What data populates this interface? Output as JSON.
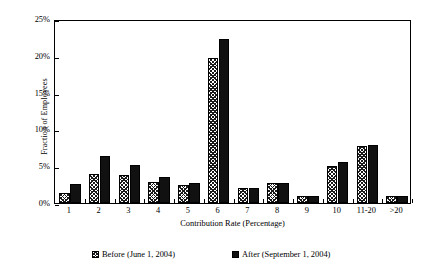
{
  "chart_data": {
    "type": "bar",
    "title": "",
    "xlabel": "Contribution Rate (Percentage)",
    "ylabel": "Fraction of Employees",
    "categories": [
      "1",
      "2",
      "3",
      "4",
      "5",
      "6",
      "7",
      "8",
      "9",
      "10",
      "11-20",
      ">20"
    ],
    "series": [
      {
        "name": "Before (June 1, 2004)",
        "values": [
          1.3,
          4.0,
          3.8,
          2.9,
          2.5,
          19.7,
          2.1,
          2.7,
          0.9,
          5.0,
          7.7,
          1.0
        ]
      },
      {
        "name": "After (September 1, 2004)",
        "values": [
          2.6,
          6.4,
          5.2,
          3.5,
          2.7,
          22.3,
          2.1,
          2.7,
          0.9,
          5.6,
          7.9,
          1.0
        ]
      }
    ],
    "ylim": [
      0,
      25
    ],
    "yticks": [
      0,
      5,
      10,
      15,
      20,
      25
    ],
    "ytick_labels": [
      "0%",
      "5%",
      "10%",
      "15%",
      "20%",
      "25%"
    ],
    "grid": false,
    "legend_position": "bottom"
  },
  "legend": {
    "entries": [
      {
        "label": "Before (June 1, 2004)",
        "pattern": "hatched-diagonal"
      },
      {
        "label": "After (September 1, 2004)",
        "pattern": "solid-black"
      }
    ]
  },
  "colors": {
    "axis": "#000000",
    "before_fill": "#ffffff",
    "before_hatch": "#1a1a1a",
    "after_fill": "#111111",
    "background": "#ffffff"
  }
}
